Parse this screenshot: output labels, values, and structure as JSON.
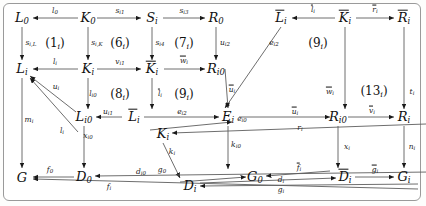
{
  "figure": {
    "type": "commutative-diagram",
    "width": 426,
    "height": 206,
    "background": "#ffffff",
    "border_color": "#9a9a9a"
  },
  "nodes": [
    {
      "id": "L0",
      "base": "L",
      "sub": "0",
      "overline": false,
      "x": 22,
      "y": 18
    },
    {
      "id": "K0",
      "base": "K",
      "sub": "0",
      "overline": false,
      "x": 88,
      "y": 18
    },
    {
      "id": "Si",
      "base": "S",
      "sub": "i",
      "overline": false,
      "x": 152,
      "y": 18
    },
    {
      "id": "R0",
      "base": "R",
      "sub": "0",
      "overline": false,
      "x": 216,
      "y": 18
    },
    {
      "id": "Lbar_i",
      "base": "L",
      "sub": "i",
      "overline": true,
      "x": 281,
      "y": 18
    },
    {
      "id": "Kbar_i",
      "base": "K",
      "sub": "i",
      "overline": true,
      "x": 345,
      "y": 18
    },
    {
      "id": "Rbar_i",
      "base": "R",
      "sub": "i",
      "overline": true,
      "x": 404,
      "y": 18
    },
    {
      "id": "Li",
      "base": "L",
      "sub": "i",
      "overline": false,
      "x": 22,
      "y": 69
    },
    {
      "id": "Ki",
      "base": "K",
      "sub": "i",
      "overline": false,
      "x": 88,
      "y": 69
    },
    {
      "id": "Kbar_i2",
      "base": "K",
      "sub": "i",
      "overline": true,
      "x": 152,
      "y": 69
    },
    {
      "id": "Ri0",
      "base": "R",
      "sub": "i0",
      "overline": false,
      "x": 216,
      "y": 69
    },
    {
      "id": "Li0b",
      "base": "L",
      "sub": "i0",
      "overline": false,
      "x": 0,
      "y": 0
    },
    {
      "id": "Li0",
      "base": "L",
      "sub": "i0",
      "overline": false,
      "x": 84,
      "y": 117
    },
    {
      "id": "Lbar_i2",
      "base": "L",
      "sub": "i",
      "overline": true,
      "x": 134,
      "y": 117
    },
    {
      "id": "Ei",
      "base": "E",
      "sub": "i",
      "overline": false,
      "x": 228,
      "y": 117
    },
    {
      "id": "Ri0b",
      "base": "R",
      "sub": "i0",
      "overline": false,
      "x": 338,
      "y": 117
    },
    {
      "id": "Ri",
      "base": "R",
      "sub": "i",
      "overline": false,
      "x": 404,
      "y": 117
    },
    {
      "id": "Ki2",
      "base": "K",
      "sub": "i",
      "overline": false,
      "x": 163,
      "y": 134
    },
    {
      "id": "G",
      "base": "G",
      "sub": "",
      "overline": false,
      "x": 22,
      "y": 177
    },
    {
      "id": "D0",
      "base": "D",
      "sub": "0",
      "overline": false,
      "x": 84,
      "y": 177
    },
    {
      "id": "Di",
      "base": "D",
      "sub": "i",
      "overline": false,
      "x": 190,
      "y": 186
    },
    {
      "id": "G0",
      "base": "G",
      "sub": "0",
      "overline": false,
      "x": 255,
      "y": 177
    },
    {
      "id": "Dbar_i",
      "base": "D",
      "sub": "i",
      "overline": true,
      "x": 345,
      "y": 177
    },
    {
      "id": "Gi",
      "base": "G",
      "sub": "i",
      "overline": false,
      "x": 404,
      "y": 177
    }
  ],
  "arrow_labels": [
    {
      "id": "l0",
      "text": "l",
      "sub": "0",
      "overline": false,
      "x": 55,
      "y": 11
    },
    {
      "id": "si1",
      "text": "s",
      "sub": "i1",
      "overline": false,
      "x": 120,
      "y": 11
    },
    {
      "id": "si3",
      "text": "s",
      "sub": "i3",
      "overline": false,
      "x": 184,
      "y": 11
    },
    {
      "id": "lbar_i_top",
      "text": "l",
      "sub": "i",
      "overline": true,
      "x": 313,
      "y": 10
    },
    {
      "id": "rbar_i_top",
      "text": "r",
      "sub": "i",
      "overline": true,
      "x": 375,
      "y": 10
    },
    {
      "id": "siL",
      "text": "s",
      "sub": "i,L",
      "overline": false,
      "x": 31,
      "y": 43
    },
    {
      "id": "siK",
      "text": "s",
      "sub": "i,K",
      "overline": false,
      "x": 97,
      "y": 43
    },
    {
      "id": "si4",
      "text": "s",
      "sub": "i4",
      "overline": false,
      "x": 160,
      "y": 43
    },
    {
      "id": "ui2",
      "text": "u",
      "sub": "i2",
      "overline": false,
      "x": 225,
      "y": 43
    },
    {
      "id": "li",
      "text": "l",
      "sub": "i",
      "overline": false,
      "x": 55,
      "y": 62
    },
    {
      "id": "vi1",
      "text": "v",
      "sub": "i1",
      "overline": false,
      "x": 120,
      "y": 62
    },
    {
      "id": "wbar_i_mid",
      "text": "w",
      "sub": "i",
      "overline": true,
      "x": 184,
      "y": 61
    },
    {
      "id": "ui_diag",
      "text": "u",
      "sub": "i",
      "overline": false,
      "x": 56,
      "y": 87
    },
    {
      "id": "li0",
      "text": "l",
      "sub": "i0",
      "overline": false,
      "x": 93,
      "y": 94
    },
    {
      "id": "lbar_i_mid",
      "text": "l",
      "sub": "i",
      "overline": true,
      "x": 160,
      "y": 94
    },
    {
      "id": "ebar_i2",
      "text": "e",
      "sub": "i2",
      "overline": false,
      "x": 274,
      "y": 43
    },
    {
      "id": "ubar_i_diag",
      "text": "u",
      "sub": "i",
      "overline": true,
      "x": 232,
      "y": 90
    },
    {
      "id": "wbar_i_right",
      "text": "w",
      "sub": "i",
      "overline": true,
      "x": 330,
      "y": 92
    },
    {
      "id": "ti",
      "text": "t",
      "sub": "i",
      "overline": false,
      "x": 412,
      "y": 92
    },
    {
      "id": "ui1",
      "text": "u",
      "sub": "i1",
      "overline": false,
      "x": 108,
      "y": 112
    },
    {
      "id": "ei2",
      "text": "e",
      "sub": "i2",
      "overline": false,
      "x": 182,
      "y": 112
    },
    {
      "id": "ei0",
      "text": "e",
      "sub": "i0",
      "overline": false,
      "x": 242,
      "y": 119
    },
    {
      "id": "ubar_i_right",
      "text": "u",
      "sub": "i",
      "overline": true,
      "x": 295,
      "y": 112
    },
    {
      "id": "vbar_i",
      "text": "v",
      "sub": "i",
      "overline": true,
      "x": 372,
      "y": 111
    },
    {
      "id": "mi",
      "text": "m",
      "sub": "i",
      "overline": false,
      "x": 29,
      "y": 120
    },
    {
      "id": "li_curve",
      "text": "l",
      "sub": "i",
      "overline": false,
      "x": 62,
      "y": 131
    },
    {
      "id": "xi0",
      "text": "x",
      "sub": "i0",
      "overline": false,
      "x": 88,
      "y": 136
    },
    {
      "id": "ri",
      "text": "r",
      "sub": "i",
      "overline": false,
      "x": 300,
      "y": 128
    },
    {
      "id": "ki0",
      "text": "k",
      "sub": "i0",
      "overline": false,
      "x": 236,
      "y": 145
    },
    {
      "id": "ki",
      "text": "k",
      "sub": "i",
      "overline": false,
      "x": 172,
      "y": 152
    },
    {
      "id": "xi",
      "text": "x",
      "sub": "i",
      "overline": false,
      "x": 347,
      "y": 147
    },
    {
      "id": "ni",
      "text": "n",
      "sub": "i",
      "overline": false,
      "x": 412,
      "y": 147
    },
    {
      "id": "f0",
      "text": "f",
      "sub": "0",
      "overline": false,
      "x": 50,
      "y": 170
    },
    {
      "id": "di0",
      "text": "d",
      "sub": "i0",
      "overline": false,
      "x": 141,
      "y": 172
    },
    {
      "id": "fi",
      "text": "f",
      "sub": "i",
      "overline": false,
      "x": 109,
      "y": 187
    },
    {
      "id": "g0",
      "text": "g",
      "sub": "0",
      "overline": false,
      "x": 162,
      "y": 170
    },
    {
      "id": "fbar_i",
      "text": "f",
      "sub": "i",
      "overline": true,
      "x": 299,
      "y": 168
    },
    {
      "id": "di",
      "text": "d",
      "sub": "i",
      "overline": false,
      "x": 281,
      "y": 180
    },
    {
      "id": "gi",
      "text": "g",
      "sub": "i",
      "overline": false,
      "x": 281,
      "y": 190
    },
    {
      "id": "gbar_i",
      "text": "g",
      "sub": "i",
      "overline": true,
      "x": 375,
      "y": 170
    }
  ],
  "square_labels": [
    {
      "id": "sq1",
      "text": "(1",
      "sub": "i",
      "close": ")",
      "x": 55,
      "y": 44
    },
    {
      "id": "sq6",
      "text": "(6",
      "sub": "i",
      "close": ")",
      "x": 120,
      "y": 44
    },
    {
      "id": "sq7",
      "text": "(7",
      "sub": "i",
      "close": ")",
      "x": 184,
      "y": 44
    },
    {
      "id": "sq8",
      "text": "(8",
      "sub": "i",
      "close": ")",
      "x": 120,
      "y": 95
    },
    {
      "id": "sq9a",
      "text": "(9",
      "sub": "i",
      "close": ")",
      "x": 184,
      "y": 95
    },
    {
      "id": "sq9b",
      "text": "(9",
      "sub": "i",
      "close": ")",
      "x": 318,
      "y": 44
    },
    {
      "id": "sq13",
      "text": "(13",
      "sub": "i",
      "close": ")",
      "x": 374,
      "y": 92
    }
  ]
}
